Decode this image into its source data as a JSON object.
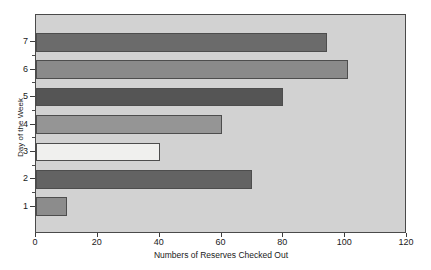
{
  "chart_data": {
    "type": "bar",
    "orientation": "horizontal",
    "title": "",
    "xlabel": "Numbers of Reserves Checked Out",
    "ylabel": "Day of the Week",
    "categories": [
      "1",
      "2",
      "3",
      "4",
      "5",
      "6",
      "7"
    ],
    "values": [
      10,
      70,
      40,
      60,
      80,
      101,
      94
    ],
    "bar_colors": [
      "#8c8c8c",
      "#636363",
      "#f0f0ee",
      "#959595",
      "#555555",
      "#8a8a8a",
      "#6b6b6b"
    ],
    "xlim": [
      0,
      120
    ],
    "ylim": [
      0,
      8
    ],
    "xticks": [
      0,
      20,
      40,
      60,
      80,
      100,
      120
    ],
    "xtick_labels": [
      "0",
      "20",
      "40",
      "60",
      "80",
      "100",
      "120"
    ],
    "yticks": [
      1,
      2,
      3,
      4,
      5,
      6,
      7
    ],
    "ytick_labels": [
      "1",
      "2",
      "3",
      "4",
      "5",
      "6",
      "7"
    ],
    "y_minor_ticks": [
      1.5,
      2.5,
      3.5,
      4.5,
      5.5,
      6.5
    ],
    "grid": false,
    "legend": null,
    "plot_background": "#d2d2d2",
    "figure_background": "#ffffff",
    "axis_color": "#3c3c3c",
    "bar_edge_color": "#4d4d4d"
  }
}
